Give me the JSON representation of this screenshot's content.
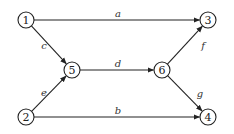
{
  "diagram": {
    "type": "directed-graph",
    "node_radius": 8,
    "nodes": [
      {
        "id": "1",
        "label": "1",
        "x": 26,
        "y": 20
      },
      {
        "id": "2",
        "label": "2",
        "x": 26,
        "y": 117
      },
      {
        "id": "3",
        "label": "3",
        "x": 208,
        "y": 20
      },
      {
        "id": "4",
        "label": "4",
        "x": 208,
        "y": 117
      },
      {
        "id": "5",
        "label": "5",
        "x": 72,
        "y": 70
      },
      {
        "id": "6",
        "label": "6",
        "x": 162,
        "y": 70
      }
    ],
    "edges": [
      {
        "id": "a",
        "label": "a",
        "from": "1",
        "to": "3",
        "lx": 118,
        "ly": 13
      },
      {
        "id": "b",
        "label": "b",
        "from": "2",
        "to": "4",
        "lx": 118,
        "ly": 110
      },
      {
        "id": "c",
        "label": "c",
        "from": "1",
        "to": "5",
        "lx": 44,
        "ly": 45
      },
      {
        "id": "d",
        "label": "d",
        "from": "5",
        "to": "6",
        "lx": 118,
        "ly": 63
      },
      {
        "id": "e",
        "label": "e",
        "from": "2",
        "to": "5",
        "lx": 44,
        "ly": 92
      },
      {
        "id": "f",
        "label": "f",
        "from": "6",
        "to": "3",
        "lx": 203,
        "ly": 45
      },
      {
        "id": "g",
        "label": "g",
        "from": "6",
        "to": "4",
        "lx": 200,
        "ly": 93
      }
    ],
    "colors": {
      "stroke": "#222222",
      "background": "#ffffff"
    }
  }
}
